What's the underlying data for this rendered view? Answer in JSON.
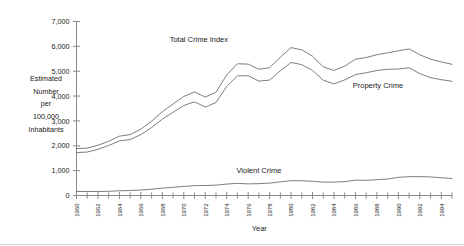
{
  "chart_data": {
    "type": "line",
    "title": "",
    "subtitle": "",
    "xlabel": "Year",
    "ylabel_lines": [
      "Estimated",
      "Number",
      "per",
      "100,000",
      "Inhabitants"
    ],
    "ylabel": "Estimated Number per 100,000 Inhabitants",
    "grid": false,
    "legend_position": "inline-annotations",
    "xlim": [
      1960,
      1995
    ],
    "ylim": [
      0,
      7000
    ],
    "ytick_values": [
      0,
      1000,
      2000,
      3000,
      4000,
      5000,
      6000,
      7000
    ],
    "ytick_labels": [
      "0",
      "1,000",
      "2,000",
      "3,000",
      "4,000",
      "5,000",
      "6,000",
      "7,000"
    ],
    "xtick_labels": [
      "1960",
      "1962",
      "1964",
      "1966",
      "1968",
      "1970",
      "1972",
      "1974",
      "1976",
      "1978",
      "1980",
      "1982",
      "1984",
      "1986",
      "1988",
      "1990",
      "1992",
      "1994"
    ],
    "xtick_values": [
      1960,
      1962,
      1964,
      1966,
      1968,
      1970,
      1972,
      1974,
      1976,
      1978,
      1980,
      1982,
      1984,
      1986,
      1988,
      1990,
      1992,
      1994
    ],
    "xminor_values": [
      1961,
      1963,
      1965,
      1967,
      1969,
      1971,
      1973,
      1975,
      1977,
      1979,
      1981,
      1983,
      1985,
      1987,
      1989,
      1991,
      1993,
      1995
    ],
    "x": [
      1960,
      1961,
      1962,
      1963,
      1964,
      1965,
      1966,
      1967,
      1968,
      1969,
      1970,
      1971,
      1972,
      1973,
      1974,
      1975,
      1976,
      1977,
      1978,
      1979,
      1980,
      1981,
      1982,
      1983,
      1984,
      1985,
      1986,
      1987,
      1988,
      1989,
      1990,
      1991,
      1992,
      1993,
      1994,
      1995
    ],
    "series": [
      {
        "name": "Total Crime Index",
        "color": "#6e6e6e",
        "label_x": 1971.4,
        "label_y": 6180,
        "values": [
          1887,
          1906,
          2020,
          2180,
          2388,
          2449,
          2671,
          2990,
          3370,
          3680,
          3985,
          4165,
          3961,
          4155,
          4850,
          5299,
          5287,
          5078,
          5140,
          5566,
          5950,
          5858,
          5604,
          5175,
          5031,
          5207,
          5480,
          5550,
          5664,
          5741,
          5820,
          5898,
          5660,
          5485,
          5374,
          5278
        ]
      },
      {
        "name": "Property Crime",
        "color": "#6e6e6e",
        "label_x": 1988.1,
        "label_y": 4320,
        "values": [
          1726,
          1747,
          1857,
          2012,
          2198,
          2249,
          2450,
          2736,
          3071,
          3351,
          3621,
          3769,
          3561,
          3737,
          4389,
          4811,
          4820,
          4602,
          4643,
          5017,
          5353,
          5264,
          5033,
          4637,
          4492,
          4651,
          4863,
          4940,
          5027,
          5078,
          5089,
          5140,
          4903,
          4738,
          4660,
          4593
        ]
      },
      {
        "name": "Violent Crime",
        "color": "#6e6e6e",
        "label_x": 1977.0,
        "label_y": 900,
        "values": [
          161,
          159,
          162,
          168,
          190,
          200,
          220,
          253,
          298,
          329,
          364,
          396,
          401,
          417,
          461,
          488,
          468,
          476,
          498,
          549,
          597,
          594,
          571,
          538,
          539,
          556,
          618,
          610,
          637,
          663,
          732,
          758,
          758,
          747,
          714,
          685
        ]
      }
    ]
  }
}
